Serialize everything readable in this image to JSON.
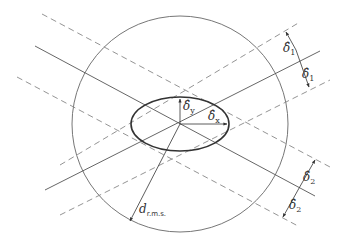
{
  "diagram": {
    "colors": {
      "stroke": "#555555",
      "dashed": "#888888",
      "ellipse": "#333333",
      "text": "#333333",
      "background": "#ffffff"
    },
    "labels": {
      "delta1_upper": {
        "main": "δ̂",
        "sub": "1"
      },
      "delta1_lower": {
        "main": "δ̂",
        "sub": "1"
      },
      "delta2_upper": {
        "main": "δ̂",
        "sub": "2"
      },
      "delta2_lower": {
        "main": "δ̂",
        "sub": "2"
      },
      "delta_y": {
        "main": "δ̂",
        "sub": "y"
      },
      "delta_x": {
        "main": "δ̂",
        "sub": "x"
      },
      "d_rms": {
        "main": "d",
        "sub": "r.m.s."
      }
    }
  }
}
